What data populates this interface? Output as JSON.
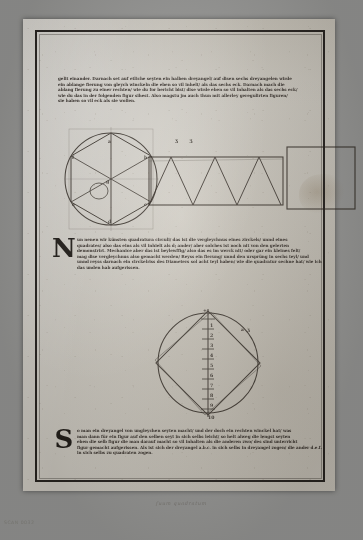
{
  "document": {
    "kind": "printed-book-page-scan",
    "paper_color": "#cfcbc2",
    "ink_color": "#241d18",
    "backdrop_color": "#9a9a98"
  },
  "text_blocks": {
    "top": {
      "id": "paragraph-top",
      "lines": [
        "gelit einander. Darnach set auf etliche seyten ein halben dreyangel/ auf disen sechs dreyangelen wirde",
        "ein ablange fierung von gleych winckeln die eben so vil inhelt/ als das sechs eck. Darnach mach die",
        "ablang fierung zu einer rechten/ wie du for bericht bist/ dise wirde eben so vil inhalten als das sechs eck/",
        "wie du das in der folgenden figur sihest. Also magstu jm auch thun mit allerley geregulirten figuren/",
        "sie haben so vil eck als sie wollen."
      ]
    },
    "middle": {
      "id": "paragraph-middle",
      "initial": "N",
      "lines": [
        "un nenen wir künsten quadratura circuli/ das ist die vergleychnus eines zirckels/ unnd eines",
        "quadrates/ also das eins als vil inhielt als d; ander/ aber solches ist noch nit von den gelerten",
        "demonstrirt. Mechanice aber das ist beylewffig/ also das es im werck nit/ oder gar ein kleines felt/",
        "mag dise vergleychnus also gemacht werden/ Reyss ein fierung/ unnd den ursprüng in sechs teyl/ und",
        "unnd reyss darnach ein circkelriss des Diameters sol acht teyl haben/ wie die quadratur sechne hat/ wie ich",
        "das unden hab aufgerissen."
      ]
    },
    "bottom": {
      "id": "paragraph-bottom",
      "initial": "S",
      "lines": [
        "o man ein dreyangel von ungleychen seyten macht/ und der doch ein rechten winckel hat/ was",
        "man dann für ein figur auf den selben seyt in sich selbs leicht/ so helt alweg die lengst seyten",
        "eben die selb figur die man darauf macht so vil inhalten als die anderen zwo/ des sind unterricht",
        "figur gemacht aufgerissen. Als ist sich der dreyangel a.b.c. in sich selbs in dreyangel zogen/ die ander d.e.f.",
        "in sich selbs zu quadraten zogen."
      ]
    }
  },
  "figures": {
    "hexagon_in_circle": {
      "name": "circle-with-inscribed-hexagon",
      "caption_marks": [],
      "vertex_labels": [
        "a",
        "b",
        "c",
        "d",
        "e",
        "f"
      ],
      "center_label": "g"
    },
    "triangle_strip": {
      "name": "triangle-strip-in-oblong",
      "triangle_count": 6,
      "marks": "ʒ ʒ"
    },
    "plain_rectangle": {
      "name": "oblong-rectangle",
      "marks": ""
    },
    "squared_circle": {
      "name": "quadrature-of-the-circle",
      "marks": "a ʒ",
      "scale_labels": [
        "1",
        "2",
        "3",
        "4",
        "5",
        "6",
        "7",
        "8",
        "9",
        "10"
      ],
      "scale_top_label": "+"
    }
  },
  "marginalia": {
    "bleed_through": "ſuum quadratum",
    "plate_caption": "SCAN 0032"
  }
}
